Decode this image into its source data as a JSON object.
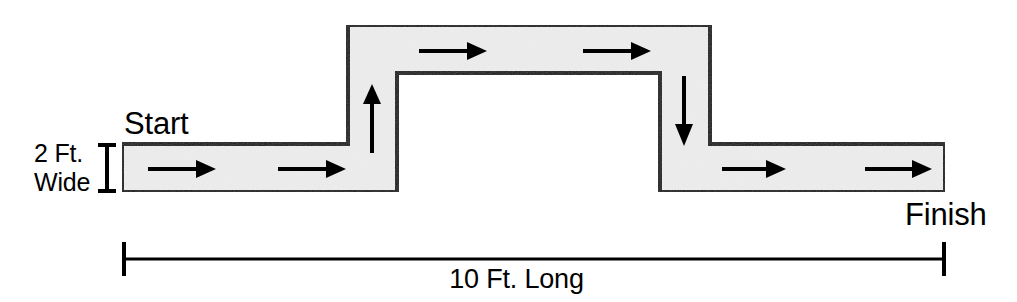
{
  "diagram": {
    "colors": {
      "path_fill": "#ededed",
      "path_stroke": "#1a1a1a",
      "arrow": "#000000",
      "text": "#000000",
      "background": "#ffffff"
    },
    "labels": {
      "start": "Start",
      "finish": "Finish",
      "width_line_1": "2 Ft.",
      "width_line_2": "Wide",
      "length": "10 Ft. Long"
    },
    "path_geometry": {
      "band_width_px": 48,
      "outline_points": "122,144 348,144 348,25 710,25 710,144 945,144 945,192 660,192 660,73 397,73 397,192 122,192",
      "sections": [
        {
          "name": "start-straightaway",
          "x1": 122,
          "y1": 144,
          "x2": 397,
          "y2": 192,
          "direction": "right"
        },
        {
          "name": "ascending-ramp",
          "x1": 348,
          "y1": 25,
          "x2": 397,
          "y2": 192,
          "direction": "up"
        },
        {
          "name": "bridge-top",
          "x1": 348,
          "y1": 25,
          "x2": 710,
          "y2": 73,
          "direction": "right"
        },
        {
          "name": "descending-ramp",
          "x1": 660,
          "y1": 25,
          "x2": 710,
          "y2": 192,
          "direction": "down"
        },
        {
          "name": "finish-straightaway",
          "x1": 660,
          "y1": 144,
          "x2": 945,
          "y2": 192,
          "direction": "right"
        }
      ]
    },
    "arrows": [
      {
        "name": "arrow-start-1",
        "direction": "right",
        "x1": 148,
        "y1": 169,
        "x2": 212,
        "y2": 169
      },
      {
        "name": "arrow-start-2",
        "direction": "right",
        "x1": 278,
        "y1": 169,
        "x2": 342,
        "y2": 169
      },
      {
        "name": "arrow-ramp-up",
        "direction": "up",
        "x1": 372,
        "y1": 153,
        "x2": 372,
        "y2": 87
      },
      {
        "name": "arrow-bridge-1",
        "direction": "right",
        "x1": 419,
        "y1": 51,
        "x2": 487,
        "y2": 51
      },
      {
        "name": "arrow-bridge-2",
        "direction": "right",
        "x1": 583,
        "y1": 51,
        "x2": 651,
        "y2": 51
      },
      {
        "name": "arrow-ramp-down",
        "direction": "down",
        "x1": 684,
        "y1": 76,
        "x2": 684,
        "y2": 142
      },
      {
        "name": "arrow-finish-1",
        "direction": "right",
        "x1": 722,
        "y1": 169,
        "x2": 784,
        "y2": 169
      },
      {
        "name": "arrow-finish-2",
        "direction": "right",
        "x1": 865,
        "y1": 169,
        "x2": 932,
        "y2": 169
      }
    ],
    "dimensions": {
      "width_marker": {
        "name": "height-dimension-marker",
        "x": 107,
        "y_top": 144,
        "y_bottom": 192,
        "cap_half": 9
      },
      "length_marker": {
        "name": "length-dimension-line",
        "x_left": 123,
        "x_right": 945,
        "y": 259,
        "cap_half": 17
      }
    }
  }
}
